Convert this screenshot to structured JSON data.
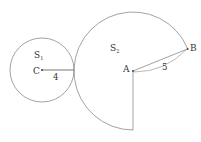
{
  "diagram": {
    "circle_small": {
      "label": "S",
      "subscript": "1",
      "center_label": "C",
      "radius_label": "4"
    },
    "sector_large": {
      "label": "S",
      "subscript": "2",
      "center_label": "A",
      "point_label": "B",
      "radius_label": "5"
    },
    "colors": {
      "stroke": "#8a8a8a",
      "text": "#333333",
      "background": "#ffffff"
    }
  }
}
